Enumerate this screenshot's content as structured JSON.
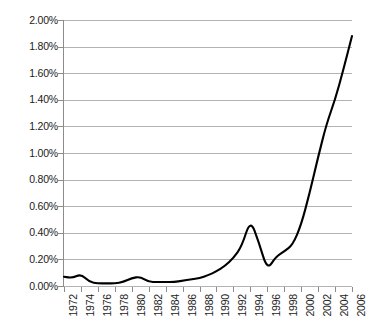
{
  "chart_data": {
    "type": "line",
    "title": "",
    "subtitle": "",
    "xlabel": "",
    "ylabel": "",
    "legend": [],
    "legend_position": "none",
    "grid": true,
    "xlim": [
      1972,
      2006
    ],
    "ylim": [
      0.0,
      2.0
    ],
    "y_tick_step": 0.2,
    "y_unit": "%",
    "x_tick_step": 2,
    "x_tick_labels": [
      "1972",
      "1974",
      "1976",
      "1978",
      "1980",
      "1982",
      "1984",
      "1986",
      "1988",
      "1990",
      "1992",
      "1994",
      "1996",
      "1998",
      "2000",
      "2002",
      "2004",
      "2006"
    ],
    "y_tick_labels": [
      "0.00%",
      "0.20%",
      "0.40%",
      "0.60%",
      "0.80%",
      "1.00%",
      "1.20%",
      "1.40%",
      "1.60%",
      "1.80%",
      "2.00%"
    ],
    "series": [
      {
        "name": "value",
        "color": "#000000",
        "x": [
          1972,
          1973,
          1974,
          1975,
          1976,
          1977,
          1978,
          1979,
          1980,
          1981,
          1982,
          1983,
          1984,
          1985,
          1986,
          1987,
          1988,
          1989,
          1990,
          1991,
          1992,
          1993,
          1994,
          1995,
          1996,
          1997,
          1998,
          1999,
          2000,
          2001,
          2002,
          2003,
          2004,
          2005,
          2006
        ],
        "values": [
          0.07,
          0.06,
          0.09,
          0.03,
          0.02,
          0.02,
          0.02,
          0.03,
          0.06,
          0.07,
          0.03,
          0.03,
          0.03,
          0.03,
          0.04,
          0.05,
          0.06,
          0.08,
          0.11,
          0.15,
          0.21,
          0.3,
          0.5,
          0.33,
          0.12,
          0.22,
          0.26,
          0.31,
          0.46,
          0.7,
          0.97,
          1.22,
          1.4,
          1.63,
          1.88
        ]
      }
    ]
  }
}
